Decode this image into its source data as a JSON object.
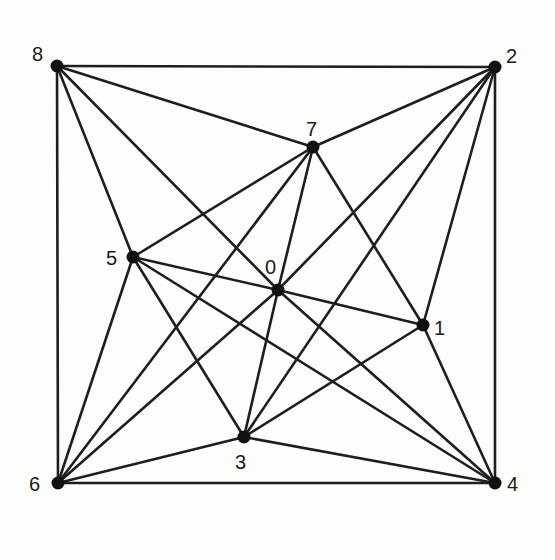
{
  "diagram": {
    "type": "graph",
    "nodes": [
      {
        "id": "0",
        "label": "0",
        "x": 278,
        "y": 290,
        "lx": 265,
        "ly": 257
      },
      {
        "id": "1",
        "label": "1",
        "x": 423,
        "y": 325,
        "lx": 434,
        "ly": 318
      },
      {
        "id": "2",
        "label": "2",
        "x": 495,
        "y": 67,
        "lx": 506,
        "ly": 46
      },
      {
        "id": "3",
        "label": "3",
        "x": 244,
        "y": 437,
        "lx": 235,
        "ly": 452
      },
      {
        "id": "4",
        "label": "4",
        "x": 495,
        "y": 483,
        "lx": 507,
        "ly": 474
      },
      {
        "id": "5",
        "label": "5",
        "x": 133,
        "y": 257,
        "lx": 106,
        "ly": 248
      },
      {
        "id": "6",
        "label": "6",
        "x": 58,
        "y": 483,
        "lx": 29,
        "ly": 474
      },
      {
        "id": "7",
        "label": "7",
        "x": 313,
        "y": 147,
        "lx": 306,
        "ly": 119
      },
      {
        "id": "8",
        "label": "8",
        "x": 57,
        "y": 66,
        "lx": 32,
        "ly": 44
      }
    ],
    "edges": [
      [
        "8",
        "2"
      ],
      [
        "8",
        "6"
      ],
      [
        "8",
        "7"
      ],
      [
        "8",
        "0"
      ],
      [
        "8",
        "5"
      ],
      [
        "2",
        "7"
      ],
      [
        "2",
        "0"
      ],
      [
        "2",
        "3"
      ],
      [
        "2",
        "1"
      ],
      [
        "2",
        "4"
      ],
      [
        "6",
        "5"
      ],
      [
        "6",
        "7"
      ],
      [
        "6",
        "0"
      ],
      [
        "6",
        "3"
      ],
      [
        "6",
        "4"
      ],
      [
        "4",
        "1"
      ],
      [
        "4",
        "0"
      ],
      [
        "4",
        "5"
      ],
      [
        "4",
        "3"
      ],
      [
        "7",
        "5"
      ],
      [
        "7",
        "0"
      ],
      [
        "7",
        "1"
      ],
      [
        "5",
        "0"
      ],
      [
        "5",
        "3"
      ],
      [
        "0",
        "1"
      ],
      [
        "0",
        "3"
      ],
      [
        "1",
        "3"
      ]
    ],
    "colors": {
      "line": "#1e1e1e",
      "node": "#111111",
      "background": "#fdfdfc"
    }
  }
}
